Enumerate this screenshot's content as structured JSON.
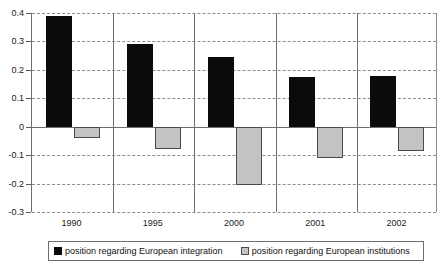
{
  "chart_data": {
    "type": "bar",
    "title": "",
    "subtitle": "",
    "xlabel": "",
    "ylabel": "",
    "categories": [
      "1990",
      "1995",
      "2000",
      "2001",
      "2002"
    ],
    "series": [
      {
        "name": "position regarding European integration",
        "color": "#0b0b0b",
        "values": [
          0.39,
          0.29,
          0.245,
          0.175,
          0.18
        ]
      },
      {
        "name": "position regarding European institutions",
        "color": "#c3c3c3",
        "values": [
          -0.04,
          -0.08,
          -0.205,
          -0.11,
          -0.085
        ]
      }
    ],
    "ylim": [
      -0.3,
      0.4
    ],
    "ytick_step": 0.1,
    "yticks": [
      "0.4",
      "0.3",
      "0.2",
      "0.1",
      "0",
      "-0.1",
      "-0.2",
      "-0.3"
    ],
    "ytick_values": [
      0.4,
      0.3,
      0.2,
      0.1,
      0,
      -0.1,
      -0.2,
      -0.3
    ],
    "grid": true,
    "grid_style": "dashed",
    "legend_position": "bottom",
    "zero_line": 0
  },
  "legend": {
    "entries": [
      {
        "label": "position regarding European integration",
        "swatch": "black-square-icon"
      },
      {
        "label": "position regarding European institutions",
        "swatch": "gray-square-icon"
      }
    ]
  },
  "colors": {
    "series_integration": "#0b0b0b",
    "series_institutions": "#c3c3c3",
    "axis": "#6f6f6f",
    "grid": "#8d8d8d",
    "text": "#1a1a1a",
    "background": "#ffffff"
  }
}
